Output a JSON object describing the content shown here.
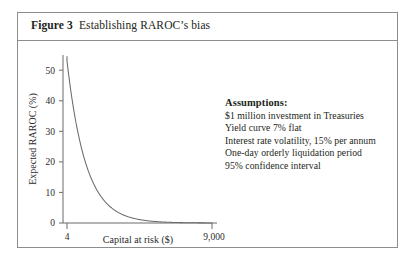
{
  "figure": {
    "label": "Figure 3",
    "caption": "Establishing RAROC’s bias"
  },
  "assumptions": {
    "heading": "Assumptions:",
    "items": [
      "$1 million investment in Treasuries",
      "Yield curve 7% flat",
      "Interest rate volatility, 15% per annum",
      "One-day orderly liquidation period",
      "95% confidence interval"
    ]
  },
  "chart_data": {
    "type": "line",
    "title": "Establishing RAROC’s bias",
    "xlabel": "Capital at risk ($)",
    "ylabel": "Expected RAROC (%)",
    "xlim": [
      4,
      9000
    ],
    "ylim": [
      0,
      55
    ],
    "xticks": [
      4,
      9000
    ],
    "xticklabels": [
      "4",
      "9,000"
    ],
    "yticks": [
      0,
      10,
      20,
      30,
      40,
      50
    ],
    "yticklabels": [
      "0",
      "10",
      "20",
      "30",
      "40",
      "50"
    ],
    "grid": false,
    "legend": false,
    "series": [
      {
        "name": "Expected RAROC",
        "relation": "y = 212 / x",
        "x": [
          4,
          5,
          6,
          8,
          10,
          14,
          20,
          30,
          45,
          70,
          110,
          170,
          260,
          400,
          620,
          950,
          1500,
          2300,
          3500,
          5500,
          7200,
          9000
        ],
        "y": [
          53.0,
          42.4,
          35.3,
          26.5,
          21.2,
          15.1,
          10.6,
          7.1,
          4.7,
          3.0,
          1.9,
          1.25,
          0.82,
          0.53,
          0.34,
          0.22,
          0.14,
          0.09,
          0.06,
          0.04,
          0.03,
          0.02
        ]
      }
    ],
    "colors": {
      "curve": "#6b6b6b",
      "axis": "#6b6b6b",
      "text": "#2b2b2b",
      "frame": "#8d8d8d"
    }
  }
}
